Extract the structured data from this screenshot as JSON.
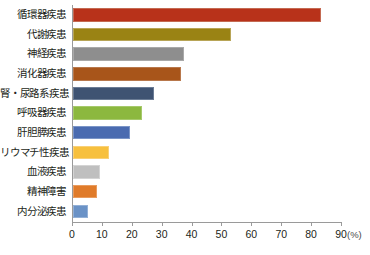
{
  "chart_data": {
    "type": "bar",
    "orientation": "horizontal",
    "title": "",
    "subtitle": "",
    "xlabel": "(%)",
    "ylabel": "",
    "xlim": [
      0,
      90
    ],
    "grid": false,
    "legend": null,
    "axis_unit": "(%)",
    "xticks": [
      0,
      10,
      20,
      30,
      40,
      50,
      60,
      70,
      80,
      90
    ],
    "xtick_labels": [
      "0",
      "10",
      "20",
      "30",
      "40",
      "50",
      "60",
      "70",
      "80",
      "90"
    ],
    "categories": [
      "循環器疾患",
      "代謝疾患",
      "神経疾患",
      "消化器疾患",
      "腎・尿路系疾患",
      "呼吸器疾患",
      "肝胆膵疾患",
      "リウマチ性疾患",
      "血液疾患",
      "精神障害",
      "内分泌疾患"
    ],
    "values": [
      83,
      53,
      37,
      36,
      27,
      23,
      19,
      12,
      9,
      8,
      5
    ],
    "colors": [
      "#b8321a",
      "#9a8314",
      "#8e8e8e",
      "#a8551a",
      "#3f5372",
      "#8cb83f",
      "#4a6bb0",
      "#f7c03e",
      "#bfbfbf",
      "#e07b2a",
      "#6a92c6"
    ],
    "bar_borders": [
      "#c46a52",
      "#b8a557",
      "#a9a9a9",
      "#b8784c",
      "#6b7c95",
      "#a6c96b",
      "#7b95c7",
      "#f9d077",
      "#d4d4d4",
      "#e99c5f",
      "#93b0d6"
    ]
  }
}
